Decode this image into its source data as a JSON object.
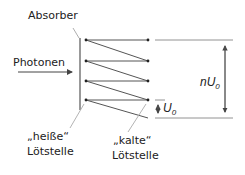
{
  "diagram": {
    "labels": {
      "absorber": "Absorber",
      "photons": "Photonen",
      "hot_junction_line1": "„heiße“",
      "hot_junction_line2": "Lötstelle",
      "cold_junction_line1": "„kalte“",
      "cold_junction_line2": "Lötstelle",
      "total_voltage": "nU",
      "total_voltage_sub": "0",
      "single_voltage": "U",
      "single_voltage_sub": "0"
    },
    "colors": {
      "line": "#555555",
      "text": "#222222",
      "leader": "#aaaaaa"
    }
  }
}
